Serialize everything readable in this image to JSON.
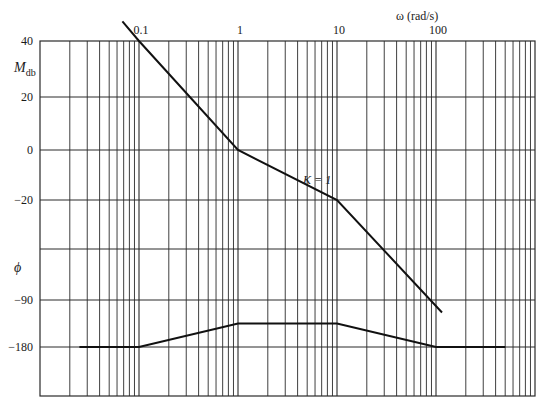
{
  "chart_data": {
    "type": "line",
    "title": "",
    "xlabel": "ω (rad/s)",
    "x_scale": "log",
    "xlim": [
      0.01,
      1000
    ],
    "x_tick_labels": [
      "0.1",
      "1",
      "10",
      "100"
    ],
    "x_tick_values": [
      0.1,
      1,
      10,
      100
    ],
    "magnitude_axis": {
      "label": "M",
      "label_sub": "db",
      "tick_labels": [
        "40",
        "20",
        "0",
        "−20"
      ],
      "tick_values": [
        40,
        20,
        0,
        -20
      ]
    },
    "phase_axis": {
      "label": "ϕ",
      "tick_labels": [
        "−90",
        "−180"
      ],
      "tick_values": [
        -90,
        -180
      ]
    },
    "grid": true,
    "annotations": [
      {
        "text": "K = 1",
        "x": 6.0,
        "y_db": -12
      }
    ],
    "series": [
      {
        "name": "Magnitude (dB)",
        "x": [
          0.068,
          0.1,
          1,
          10,
          115
        ],
        "y": [
          47,
          40,
          0,
          -20,
          -65
        ]
      },
      {
        "name": "Phase (deg)",
        "x": [
          0.025,
          0.1,
          1,
          10,
          100,
          500
        ],
        "y": [
          -180,
          -180,
          -135,
          -135,
          -180,
          -180
        ]
      }
    ]
  },
  "colors": {
    "grid": "#2a2a2a",
    "curve": "#111111",
    "background": "#ffffff"
  }
}
